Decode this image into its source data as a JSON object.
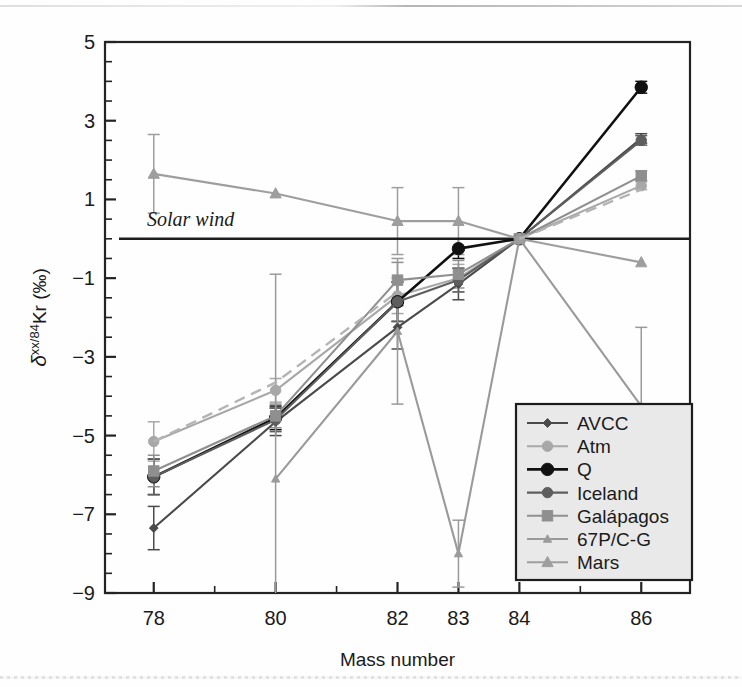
{
  "figure": {
    "annotation": "Solar wind",
    "background": "#ffffff"
  },
  "axes": {
    "x_title": "Mass number",
    "y_title_delta": "δ",
    "y_title_sup": "xx/84",
    "y_title_mid": "Kr (",
    "y_title_permil": "‰",
    "y_title_close": ")",
    "y_title_full": "δxx/84Kr (‰)",
    "x_tick_labels": [
      "78",
      "80",
      "82",
      "83",
      "84",
      "86"
    ],
    "y_tick_labels": [
      "5",
      "3",
      "1",
      "−1",
      "−3",
      "−5",
      "−7",
      "−9"
    ]
  },
  "legend": {
    "items": [
      {
        "label": "AVCC",
        "color": "#4a4a4a",
        "marker": "diamond-small",
        "dash": "none"
      },
      {
        "label": "Atm",
        "color": "#a8a8a8",
        "marker": "circle",
        "dash": "none"
      },
      {
        "label": "Q",
        "color": "#111111",
        "marker": "circle-large",
        "dash": "none"
      },
      {
        "label": "Iceland",
        "color": "#5e5e5e",
        "marker": "circle",
        "dash": "none"
      },
      {
        "label": "Galápagos",
        "color": "#8f8f8f",
        "marker": "square",
        "dash": "none"
      },
      {
        "label": "67P/C-G",
        "color": "#9a9a9a",
        "marker": "triangle-small",
        "dash": "none"
      },
      {
        "label": "Mars",
        "color": "#9e9e9e",
        "marker": "triangle",
        "dash": "none"
      }
    ]
  },
  "chart_data": {
    "type": "line",
    "title": "",
    "xlabel": "Mass number",
    "ylabel": "δxx/84Kr (‰)",
    "categories": [
      78,
      80,
      82,
      83,
      84,
      86
    ],
    "xlim": [
      77.2,
      86.8
    ],
    "ylim": [
      -9,
      5
    ],
    "yticks": [
      5,
      3,
      1,
      -1,
      -3,
      -5,
      -7,
      -9
    ],
    "grid": false,
    "legend_position": "lower-right",
    "reference_line": {
      "label": "Solar wind",
      "y": 0
    },
    "series": [
      {
        "name": "AVCC",
        "color": "#4a4a4a",
        "marker": "diamond-small",
        "values": [
          -7.35,
          -4.65,
          -2.25,
          -1.15,
          0,
          2.55
        ],
        "errors": [
          0.55,
          0.35,
          0.55,
          0.4,
          0,
          0.12
        ]
      },
      {
        "name": "Atm",
        "color": "#a8a8a8",
        "marker": "circle",
        "values": [
          -5.15,
          -3.85,
          -1.45,
          -1.0,
          0,
          1.35
        ],
        "errors": [
          0.5,
          0.3,
          0.45,
          0.35,
          0,
          0.1
        ]
      },
      {
        "name": "Q",
        "color": "#111111",
        "marker": "circle-large",
        "values": [
          -6.05,
          -4.55,
          -1.6,
          -0.25,
          0,
          3.85
        ],
        "errors": [
          0.45,
          0.3,
          0.5,
          0.25,
          0,
          0.15
        ]
      },
      {
        "name": "Iceland",
        "color": "#5e5e5e",
        "marker": "circle",
        "values": [
          -6.05,
          -4.6,
          -1.6,
          -1.05,
          0,
          2.5
        ],
        "errors": [
          0.45,
          0.3,
          0.5,
          0.3,
          0,
          0.12
        ]
      },
      {
        "name": "Galápagos",
        "color": "#8f8f8f",
        "marker": "square",
        "values": [
          -5.9,
          -4.5,
          -1.05,
          -0.9,
          0,
          1.6
        ],
        "errors": [
          0.4,
          0.3,
          0.45,
          0.35,
          0,
          0.12
        ]
      },
      {
        "name": "67P/C-G",
        "color": "#9a9a9a",
        "marker": "triangle-small",
        "values": [
          null,
          -6.1,
          -2.35,
          -8.0,
          0,
          -4.25
        ],
        "errors": [
          null,
          5.2,
          1.85,
          0.85,
          0,
          2.0
        ]
      },
      {
        "name": "Mars",
        "color": "#9e9e9e",
        "marker": "triangle",
        "values": [
          1.65,
          1.15,
          0.45,
          0.45,
          0,
          -0.6
        ],
        "errors": [
          1.0,
          0.0,
          0.85,
          0.85,
          0,
          0.0
        ]
      }
    ]
  }
}
